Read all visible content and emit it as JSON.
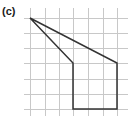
{
  "figure": {
    "label": "(c)",
    "grid": {
      "vertical_x": [
        30,
        45,
        59,
        73,
        88,
        103,
        117
      ],
      "horizontal_y": [
        18,
        33,
        48,
        63,
        79,
        94,
        109
      ],
      "x_extent": [
        24,
        128
      ],
      "y_extent": [
        8,
        116
      ],
      "color": "#c8c8c8"
    },
    "shape": {
      "type": "polygon",
      "grid_vertices": [
        [
          0,
          0
        ],
        [
          6,
          3
        ],
        [
          6,
          6
        ],
        [
          3,
          6
        ],
        [
          3,
          3
        ]
      ],
      "pixel_vertices": [
        [
          30,
          18
        ],
        [
          117,
          63
        ],
        [
          117,
          109
        ],
        [
          73,
          109
        ],
        [
          73,
          63
        ]
      ],
      "stroke": "#333333"
    }
  }
}
